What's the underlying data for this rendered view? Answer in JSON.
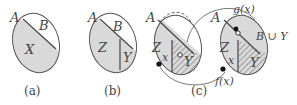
{
  "figure": {
    "panels": [
      {
        "id": "a",
        "caption": "(a)",
        "labels": {
          "set": "A",
          "upper": "B",
          "lower": "X"
        }
      },
      {
        "id": "b",
        "caption": "(b)",
        "labels": {
          "set": "A",
          "upper": "B",
          "left": "Z",
          "right": "Y"
        }
      },
      {
        "id": "c",
        "caption": "(c)",
        "left_set": {
          "set": "A",
          "region": "Z",
          "hatched": "Y",
          "point": "x"
        },
        "right_set": {
          "set": "A",
          "region": "Z",
          "hatched": "Y",
          "point": "x",
          "upper": "B ∪ Y"
        },
        "maps": {
          "f": "f(x)",
          "g": "g(x)"
        }
      }
    ],
    "colors": {
      "fill": "#d9d9d9",
      "stroke": "#555555",
      "background": "#ffffff"
    }
  }
}
